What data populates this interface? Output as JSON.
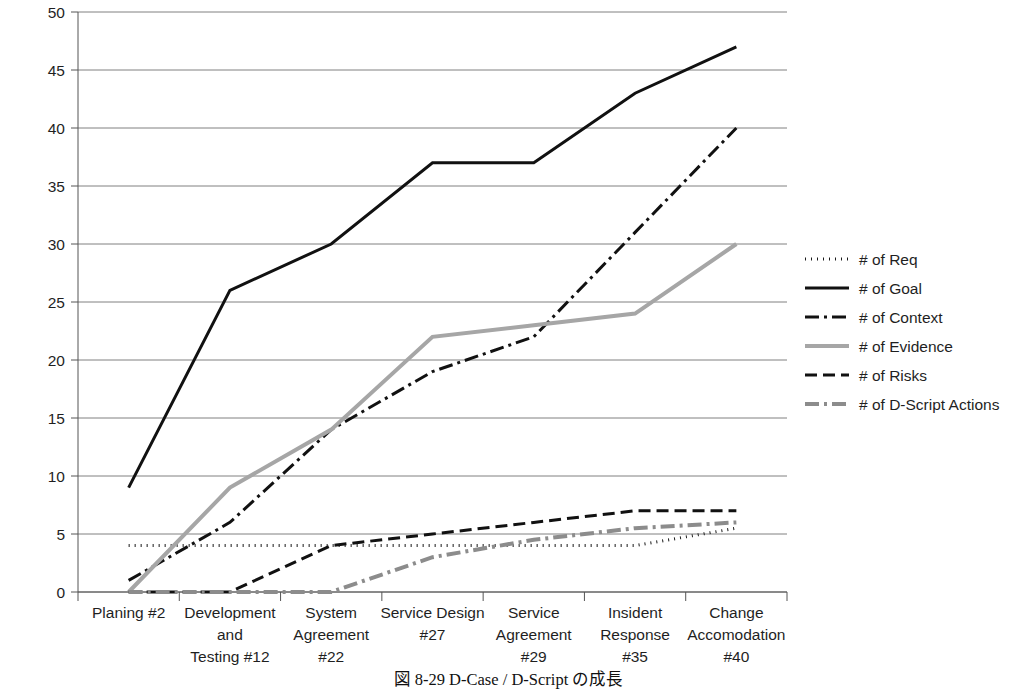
{
  "caption": "図 8-29  D-Case / D-Script の成長",
  "chart_data": {
    "type": "line",
    "title": "",
    "xlabel": "",
    "ylabel": "",
    "ylim": [
      0,
      50
    ],
    "ytick_step": 5,
    "yticks": [
      "0",
      "5",
      "10",
      "15",
      "20",
      "25",
      "30",
      "35",
      "40",
      "45",
      "50"
    ],
    "grid": true,
    "grid_color": "#808080",
    "legend_position": "right",
    "categories": [
      "Planing #2",
      "Development and Testing #12",
      "System Agreement #22",
      "Service Design #27",
      "Service Agreement #29",
      "Insident Response #35",
      "Change Accomodation #40"
    ],
    "category_lines": [
      [
        "Planing #2"
      ],
      [
        "Development",
        "and",
        "Testing #12"
      ],
      [
        "System",
        "Agreement",
        "#22"
      ],
      [
        "Service Design",
        "#27"
      ],
      [
        "Service",
        "Agreement",
        "#29"
      ],
      [
        "Insident",
        "Response",
        "#35"
      ],
      [
        "Change",
        "Accomodation",
        "#40"
      ]
    ],
    "series": [
      {
        "name": "# of Req",
        "values": [
          4,
          4,
          4,
          4,
          4,
          4,
          5.5
        ],
        "color": "#1a1a1a",
        "style": "dotted",
        "dash": "1,5",
        "width": 3
      },
      {
        "name": "# of Goal",
        "values": [
          9,
          26,
          30,
          37,
          37,
          43,
          47
        ],
        "color": "#111111",
        "style": "solid",
        "dash": "none",
        "width": 3
      },
      {
        "name": "# of Context",
        "values": [
          1,
          6,
          14,
          19,
          22,
          31,
          40
        ],
        "color": "#111111",
        "style": "dash-dot",
        "dash": "14,5,3,5",
        "width": 3
      },
      {
        "name": "# of Evidence",
        "values": [
          0,
          9,
          14,
          22,
          23,
          24,
          30
        ],
        "color": "#a6a6a6",
        "style": "solid",
        "dash": "none",
        "width": 4
      },
      {
        "name": "# of Risks",
        "values": [
          0,
          0,
          4,
          5,
          6,
          7,
          7
        ],
        "color": "#111111",
        "style": "dashed",
        "dash": "12,6",
        "width": 3
      },
      {
        "name": "# of D-Script Actions",
        "values": [
          0,
          0,
          0,
          3,
          4.5,
          5.5,
          6
        ],
        "color": "#8c8c8c",
        "style": "dash-dot",
        "dash": "14,5,3,5",
        "width": 4
      }
    ]
  }
}
